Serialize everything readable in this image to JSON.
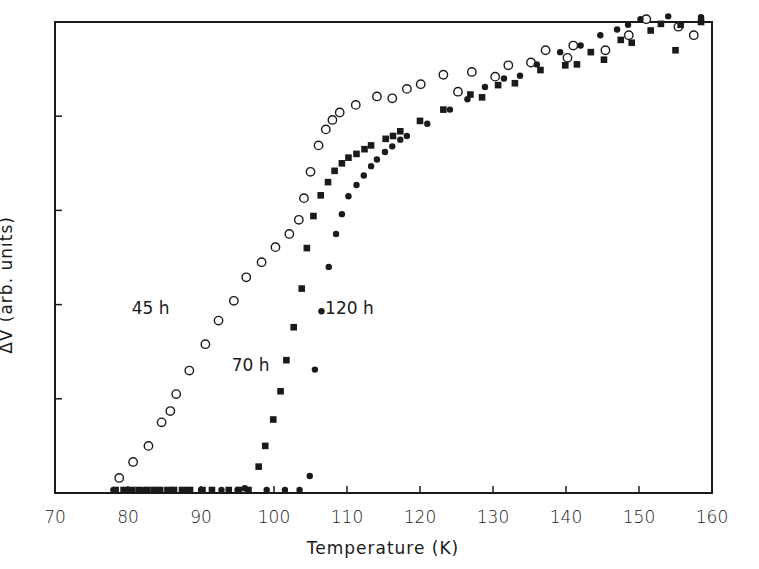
{
  "chart_data": {
    "type": "scatter",
    "title": "",
    "xlabel": "Temperature (K)",
    "ylabel": "ΔV (arb. units)",
    "xlim": [
      70,
      160
    ],
    "ylim": [
      0,
      5
    ],
    "xticks": [
      70,
      80,
      90,
      100,
      110,
      120,
      130,
      140,
      150,
      160
    ],
    "yticks": [
      0,
      1,
      2,
      3,
      4,
      5
    ],
    "ytick_labels_shown": false,
    "grid": false,
    "legend": "inline labels",
    "series": [
      {
        "name": "45 h",
        "marker": "open-circle",
        "label_pos": [
          80.5,
          1.9
        ],
        "x": [
          78.8,
          80.7,
          82.8,
          84.6,
          85.8,
          86.6,
          88.4,
          90.6,
          92.4,
          94.5,
          96.2,
          98.3,
          100.2,
          102.1,
          103.4,
          104.1,
          105.0,
          106.1,
          107.1,
          108.0,
          109.0,
          111.2,
          114.1,
          116.2,
          118.2,
          120.1,
          123.2,
          125.2,
          127.1,
          130.3,
          132.1,
          135.2,
          137.2,
          140.2,
          141.0,
          145.4,
          148.6,
          151.0,
          155.4,
          157.5
        ],
        "y": [
          0.16,
          0.33,
          0.5,
          0.75,
          0.87,
          1.05,
          1.3,
          1.58,
          1.83,
          2.04,
          2.29,
          2.45,
          2.61,
          2.75,
          2.9,
          3.13,
          3.41,
          3.69,
          3.86,
          3.96,
          4.04,
          4.12,
          4.21,
          4.19,
          4.29,
          4.34,
          4.44,
          4.26,
          4.47,
          4.42,
          4.54,
          4.57,
          4.7,
          4.62,
          4.75,
          4.7,
          4.86,
          5.03,
          4.95,
          4.86
        ]
      },
      {
        "name": "70 h",
        "marker": "filled-square",
        "label_pos": [
          94.2,
          1.3
        ],
        "x": [
          78.3,
          79.4,
          80.6,
          81.5,
          82.6,
          83.5,
          84.4,
          85.4,
          86.3,
          87.4,
          88.5,
          90.2,
          91.5,
          93.8,
          95.2,
          96.5,
          97.9,
          98.8,
          99.9,
          100.9,
          101.7,
          102.7,
          103.8,
          104.5,
          105.4,
          106.4,
          107.4,
          108.3,
          109.3,
          110.2,
          111.3,
          112.4,
          113.3,
          115.3,
          116.3,
          117.3,
          120.0,
          123.2,
          126.9,
          128.5,
          130.7,
          133.0,
          136.5,
          139.9,
          141.5,
          143.4,
          145.2,
          147.5,
          149.0,
          151.6,
          153.0,
          155.0,
          155.7,
          158.5
        ],
        "y": [
          0.0,
          0.0,
          0.0,
          0.0,
          0.0,
          0.0,
          0.0,
          0.0,
          0.0,
          0.0,
          0.0,
          0.0,
          0.0,
          0.0,
          0.0,
          0.0,
          0.28,
          0.5,
          0.78,
          1.08,
          1.41,
          1.76,
          2.17,
          2.6,
          2.94,
          3.16,
          3.3,
          3.42,
          3.5,
          3.56,
          3.6,
          3.65,
          3.69,
          3.76,
          3.79,
          3.84,
          3.95,
          4.07,
          4.23,
          4.2,
          4.33,
          4.35,
          4.49,
          4.54,
          4.55,
          4.68,
          4.6,
          4.81,
          4.78,
          4.91,
          4.98,
          4.7,
          4.97,
          5.0
        ]
      },
      {
        "name": "120 h",
        "marker": "filled-circle",
        "label_pos": [
          107.0,
          1.9
        ],
        "x": [
          78.0,
          80.0,
          82.2,
          84.0,
          86.0,
          88.0,
          90.0,
          92.8,
          95.0,
          96.0,
          99.0,
          101.5,
          103.5,
          104.9,
          105.6,
          106.5,
          107.5,
          108.5,
          109.3,
          110.2,
          111.3,
          112.3,
          113.3,
          114.1,
          115.2,
          116.2,
          117.3,
          118.2,
          121.0,
          124.1,
          126.5,
          128.9,
          131.5,
          133.7,
          136.0,
          139.2,
          142.0,
          144.7,
          147.0,
          148.5,
          150.2,
          154.0,
          158.5
        ],
        "y": [
          0.0,
          0.0,
          0.0,
          0.0,
          0.0,
          0.0,
          0.0,
          0.0,
          0.0,
          0.05,
          0.0,
          0.0,
          0.0,
          0.18,
          1.31,
          1.93,
          2.4,
          2.75,
          2.96,
          3.15,
          3.27,
          3.37,
          3.47,
          3.54,
          3.62,
          3.68,
          3.75,
          3.79,
          3.92,
          4.07,
          4.18,
          4.31,
          4.4,
          4.43,
          4.55,
          4.68,
          4.75,
          4.86,
          4.92,
          4.97,
          5.03,
          5.06,
          5.05
        ]
      }
    ]
  },
  "axes": {
    "xlabel": "Temperature (K)",
    "ylabel": "ΔV (arb. units)",
    "xtick_labels": [
      "70",
      "80",
      "90",
      "100",
      "110",
      "120",
      "130",
      "140",
      "150",
      "160"
    ]
  },
  "colors": {
    "ink": "#1a1a1a",
    "background": "#ffffff"
  }
}
